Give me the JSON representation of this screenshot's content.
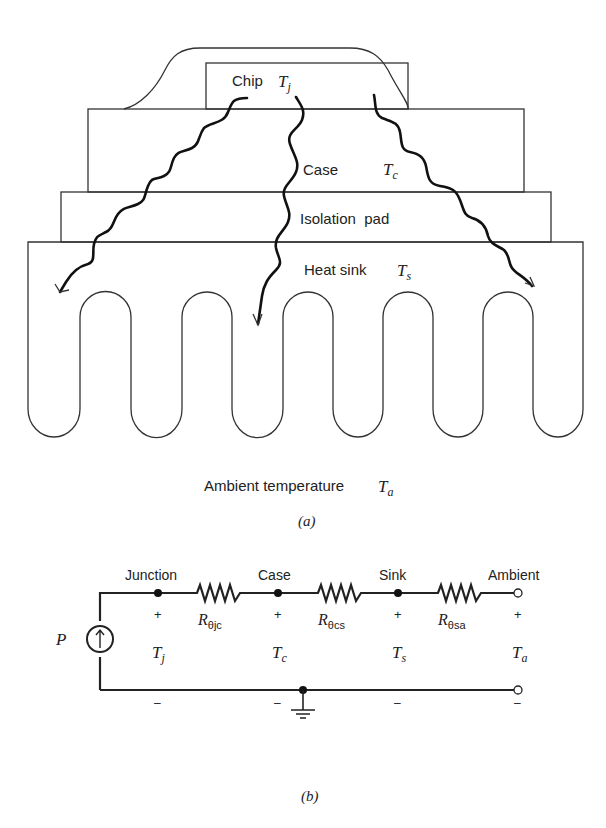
{
  "figure_a": {
    "caption": "(a)",
    "chip": {
      "label": "Chip",
      "temp_symbol": "T",
      "temp_sub": "j"
    },
    "case": {
      "label": "Case",
      "temp_symbol": "T",
      "temp_sub": "c"
    },
    "isolation_pad": {
      "label": "Isolation  pad"
    },
    "heat_sink": {
      "label": "Heat sink",
      "temp_symbol": "T",
      "temp_sub": "s"
    },
    "ambient": {
      "label": "Ambient temperature",
      "temp_symbol": "T",
      "temp_sub": "a"
    },
    "heat_flow_arrows": 3,
    "fin_count": 6
  },
  "figure_b": {
    "caption": "(b)",
    "source": {
      "label": "P"
    },
    "nodes": [
      {
        "label": "Junction",
        "plus": "+",
        "minus": "–",
        "temp_symbol": "T",
        "temp_sub": "j"
      },
      {
        "label": "Case",
        "plus": "+",
        "minus": "–",
        "temp_symbol": "T",
        "temp_sub": "c"
      },
      {
        "label": "Sink",
        "plus": "+",
        "minus": "–",
        "temp_symbol": "T",
        "temp_sub": "s"
      },
      {
        "label": "Ambient",
        "plus": "+",
        "minus": "–",
        "temp_symbol": "T",
        "temp_sub": "a"
      }
    ],
    "resistors": [
      {
        "symbol": "R",
        "sub": "θjc"
      },
      {
        "symbol": "R",
        "sub": "θcs"
      },
      {
        "symbol": "R",
        "sub": "θsa"
      }
    ]
  }
}
